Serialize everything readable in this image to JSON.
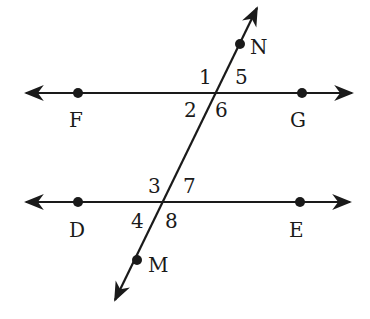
{
  "diagram": {
    "points": {
      "F": "F",
      "G": "G",
      "D": "D",
      "E": "E",
      "N": "N",
      "M": "M"
    },
    "angles": {
      "a1": "1",
      "a2": "2",
      "a5": "5",
      "a6": "6",
      "a3": "3",
      "a4": "4",
      "a7": "7",
      "a8": "8"
    },
    "colors": {
      "ink": "#1a1a1a",
      "background": "#ffffff"
    }
  }
}
